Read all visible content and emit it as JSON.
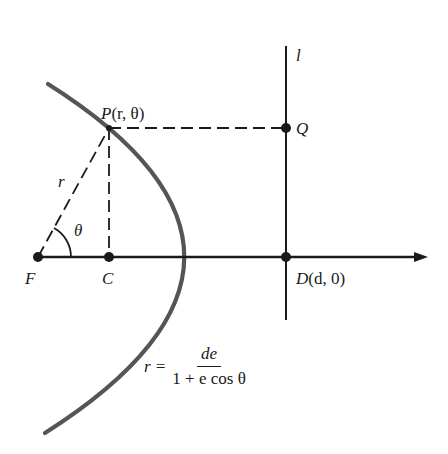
{
  "diagram": {
    "type": "conic-polar-geometry",
    "colors": {
      "curve": "#555555",
      "lines": "#1a1a1a",
      "background": "#ffffff"
    },
    "points": {
      "F": {
        "label": "F"
      },
      "C": {
        "label": "C"
      },
      "P": {
        "label": "P(r, θ)",
        "label_letter": "P",
        "label_args": "(r, θ)"
      },
      "Q": {
        "label": "Q"
      },
      "D": {
        "label": "D(d, 0)",
        "label_letter": "D",
        "label_args": "(d, 0)"
      }
    },
    "line_l": {
      "label": "l"
    },
    "segment_FP": {
      "label": "r"
    },
    "angle": {
      "label": "θ"
    },
    "formula": {
      "lhs": "r =",
      "numerator": "de",
      "denominator": "1 + e cos θ",
      "full": "r = de / (1 + e cos θ)"
    }
  }
}
